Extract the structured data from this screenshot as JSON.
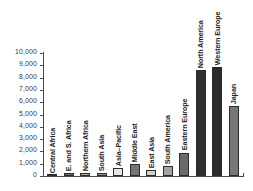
{
  "chart_data": {
    "type": "bar",
    "title": "",
    "subtitle": "",
    "xlabel": "",
    "ylabel": "",
    "ylim": [
      0,
      10000
    ],
    "grid": false,
    "legend": false,
    "y_tick_labels": [
      "10,000",
      "9,000",
      "8,000",
      "7,000",
      "6,000",
      "5,000",
      "4,000",
      "3,000",
      "2,000",
      "1,000",
      "0"
    ],
    "y_tick_values": [
      10000,
      9000,
      8000,
      7000,
      6000,
      5000,
      4000,
      3000,
      2000,
      1000,
      0
    ],
    "categories": [
      "Central Africa",
      "E. and S. Africa",
      "Northern Africa",
      "South Asia",
      "Asia–Pacific",
      "Middle East",
      "East Asia",
      "South America",
      "Eastern Europe",
      "North America",
      "Western Europe",
      "Japan"
    ],
    "values": [
      100,
      250,
      220,
      230,
      650,
      980,
      450,
      820,
      1900,
      8600,
      8850,
      5700
    ],
    "bar_colors": [
      "#8f8f8f",
      "#6e6e6e",
      "#b4b4b4",
      "#9a9a9a",
      "#e6e6e6",
      "#757575",
      "#cfcfcf",
      "#a5a5a5",
      "#6b6b6b",
      "#2f2f2f",
      "#2b2b2b",
      "#777777"
    ]
  },
  "axis": {
    "line_color": "#4d4d4d"
  }
}
